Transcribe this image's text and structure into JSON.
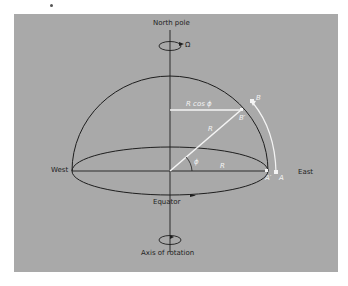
{
  "diagram": {
    "labels": {
      "north_pole": "North pole",
      "omega": "Ω",
      "r_cos_phi": "R cos ϕ",
      "point_b": "B",
      "point_b_prime": "B′",
      "radius_inclined": "R",
      "radius_equatorial": "R",
      "phi": "ϕ",
      "west": "West",
      "east": "East",
      "point_a_prime": "A′",
      "point_a": "A",
      "equator": "Equator",
      "axis_of_rotation": "Axis of rotation"
    },
    "colors": {
      "panel": "#a9a9a9",
      "lines": "#1e1e1e",
      "highlight": "#f4f4f4"
    }
  }
}
